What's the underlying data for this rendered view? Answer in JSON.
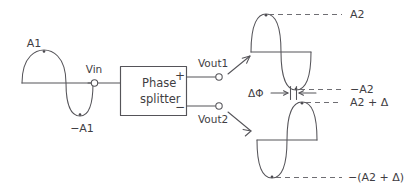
{
  "diagram": {
    "block": {
      "line1": "Phase",
      "line2": "splitter",
      "plus_sign": "+",
      "minus_sign": "−"
    },
    "terminals": {
      "input_label": "Vin",
      "output1_label": "Vout1",
      "output2_label": "Vout2"
    },
    "input_wave": {
      "peak_label": "A1",
      "trough_label": "−A1"
    },
    "output_wave_1": {
      "peak_label": "A2",
      "trough_label": "−A2"
    },
    "output_wave_2": {
      "peak_label": "A2 + Δ",
      "trough_label": "−(A2 + Δ)"
    },
    "annotation": {
      "phase_difference_label": "ΔΦ"
    },
    "colors": {
      "stroke": "#555459",
      "text": "#3f3e43",
      "dash": "#6f6e73",
      "background": "#ffffff"
    }
  }
}
